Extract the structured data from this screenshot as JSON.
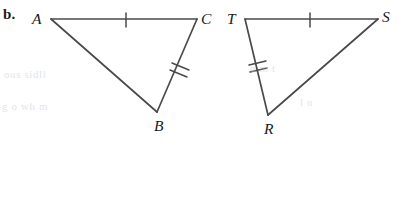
{
  "problem": {
    "label": "b."
  },
  "colors": {
    "stroke": "#4a4a4a",
    "label_text": "#1a1a1a",
    "background": "#ffffff",
    "bleed_through": "#c8d0dc"
  },
  "figure": {
    "triangles": [
      {
        "name": "triangle-abc",
        "vertices": [
          {
            "label": "A",
            "x": 51,
            "y": 19,
            "label_x": 32,
            "label_y": 11
          },
          {
            "label": "C",
            "x": 197,
            "y": 19,
            "label_x": 201,
            "label_y": 11
          },
          {
            "label": "B",
            "x": 157,
            "y": 112,
            "label_x": 154,
            "label_y": 118
          }
        ],
        "sides": [
          {
            "name": "AC",
            "from": "A",
            "to": "C",
            "ticks": 1
          },
          {
            "name": "CB",
            "from": "C",
            "to": "B",
            "ticks": 2
          },
          {
            "name": "BA",
            "from": "B",
            "to": "A",
            "ticks": 0
          }
        ]
      },
      {
        "name": "triangle-trs",
        "vertices": [
          {
            "label": "T",
            "x": 245,
            "y": 19,
            "label_x": 227,
            "label_y": 11
          },
          {
            "label": "S",
            "x": 378,
            "y": 19,
            "label_x": 382,
            "label_y": 9
          },
          {
            "label": "R",
            "x": 268,
            "y": 115,
            "label_x": 264,
            "label_y": 121
          }
        ],
        "sides": [
          {
            "name": "TS",
            "from": "T",
            "to": "S",
            "ticks": 1
          },
          {
            "name": "TR",
            "from": "T",
            "to": "R",
            "ticks": 2
          },
          {
            "name": "RS",
            "from": "R",
            "to": "S",
            "ticks": 0
          }
        ]
      }
    ]
  },
  "bleed_through_text": [
    {
      "text": "ous   sidll",
      "x": 4,
      "y": 68
    },
    {
      "text": "g  o wh  m",
      "x": 2,
      "y": 100
    },
    {
      "text": "o  m  t",
      "x": 250,
      "y": 62
    },
    {
      "text": "l    u",
      "x": 300,
      "y": 96
    }
  ]
}
